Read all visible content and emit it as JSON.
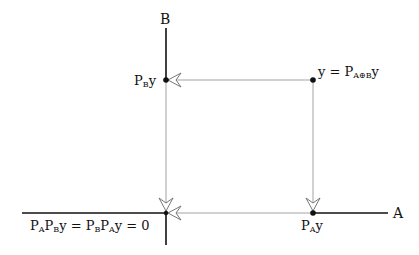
{
  "diagram": {
    "axes": {
      "horizontal_label": "A",
      "vertical_label": "B"
    },
    "points": [
      {
        "id": "y",
        "label_main": "y = P",
        "label_sub": "A⊕B",
        "label_tail": "y"
      },
      {
        "id": "PBy",
        "label_main": "P",
        "label_sub": "B",
        "label_tail": "y"
      },
      {
        "id": "PAy",
        "label_main": "P",
        "label_sub": "A",
        "label_tail": "y"
      },
      {
        "id": "origin",
        "parts": [
          {
            "main": "P",
            "sub": "A"
          },
          {
            "main": "P",
            "sub": "B"
          },
          {
            "main": "y = P",
            "sub": "B"
          },
          {
            "main": "P",
            "sub": "A"
          },
          {
            "main": "y = 0",
            "sub": ""
          }
        ]
      }
    ],
    "arrows": [
      {
        "from": "y",
        "to": "PBy",
        "direction": "left"
      },
      {
        "from": "y",
        "to": "PAy",
        "direction": "down"
      },
      {
        "from": "PBy",
        "to": "origin",
        "direction": "down"
      },
      {
        "from": "PAy",
        "to": "origin",
        "direction": "left"
      }
    ],
    "colors": {
      "axis": "#111111",
      "projection_line": "#999999",
      "point": "#111111"
    }
  }
}
